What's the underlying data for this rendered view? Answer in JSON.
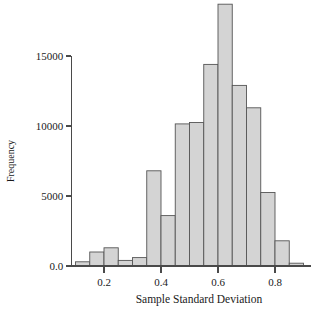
{
  "chart_data": {
    "type": "bar",
    "title": "",
    "subtitle": "",
    "xlabel": "Sample Standard Deviation",
    "ylabel": "Frequency",
    "grid": false,
    "legend": null,
    "xlim": [
      0.085,
      0.915
    ],
    "ylim": [
      0,
      19000
    ],
    "xticks": [
      0.2,
      0.4,
      0.6,
      0.8
    ],
    "xtick_labels": [
      "0.2",
      "0.4",
      "0.6",
      "0.8"
    ],
    "yticks": [
      0,
      5000,
      10000,
      15000
    ],
    "ytick_labels": [
      "0.0",
      "5000",
      "10000",
      "15000"
    ],
    "bin_width": 0.05,
    "bin_edges": [
      0.1,
      0.15,
      0.2,
      0.25,
      0.3,
      0.35,
      0.4,
      0.45,
      0.5,
      0.55,
      0.6,
      0.65,
      0.7,
      0.75,
      0.8,
      0.85,
      0.9
    ],
    "categories": [
      "0.10-0.15",
      "0.15-0.20",
      "0.20-0.25",
      "0.25-0.30",
      "0.30-0.35",
      "0.35-0.40",
      "0.40-0.45",
      "0.45-0.50",
      "0.50-0.55",
      "0.55-0.60",
      "0.60-0.65",
      "0.65-0.70",
      "0.70-0.75",
      "0.75-0.80",
      "0.80-0.85",
      "0.85-0.90"
    ],
    "values": [
      300,
      1000,
      1300,
      400,
      600,
      6800,
      3600,
      10150,
      10250,
      14400,
      18700,
      12900,
      11300,
      5250,
      1800,
      200
    ],
    "bar_fill_color": "#d4d4d4",
    "bar_edge_color": "#555555",
    "axis_color": "#4a4a4a",
    "background_color": "#ffffff"
  }
}
